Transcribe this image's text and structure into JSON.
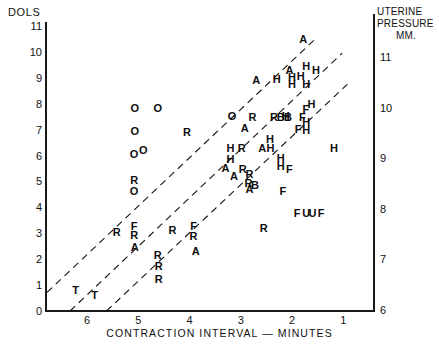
{
  "chart_data": {
    "type": "scatter",
    "title": "",
    "xlabel": "CONTRACTION  INTERVAL — MINUTES",
    "ylabel_left": "DOLS",
    "ylabel_right": "UTERINE PRESSURE MM.",
    "ylabel_right_lines": [
      "UTERINE",
      "PRESSURE",
      "MM."
    ],
    "xlim": [
      6.8,
      0.4
    ],
    "x_ticks": [
      "6",
      "5",
      "4",
      "3",
      "2",
      "1"
    ],
    "x_tick_values": [
      6,
      5,
      4,
      3,
      2,
      1
    ],
    "ylim_left": [
      0,
      11
    ],
    "y_ticks_left": [
      "0",
      "1",
      "2",
      "3",
      "4",
      "5",
      "6",
      "7",
      "8",
      "9",
      "10",
      "11"
    ],
    "y_tick_values_left": [
      0,
      1,
      2,
      3,
      4,
      5,
      6,
      7,
      8,
      9,
      10,
      11
    ],
    "ylim_right": [
      6,
      11
    ],
    "y_ticks_right": [
      "6",
      "7",
      "8",
      "9",
      "10",
      "11"
    ],
    "y_tick_values_right": [
      6,
      7,
      8,
      9,
      10,
      11
    ],
    "grid": false,
    "legend": "none",
    "marker_style": "letter-coded subject initials",
    "reference_lines": [
      {
        "name": "upper-isobar",
        "style": "dashed",
        "x1": 6.78,
        "y1": 0.72,
        "x2": 1.52,
        "y2": 10.55
      },
      {
        "name": "middle-isobar",
        "style": "dashed",
        "x1": 6.33,
        "y1": 0.0,
        "x2": 1.02,
        "y2": 9.95
      },
      {
        "name": "lower-isobar",
        "style": "dashed",
        "x1": 5.62,
        "y1": 0.0,
        "x2": 0.92,
        "y2": 8.75
      }
    ],
    "points": [
      {
        "label": "O",
        "x": 5.07,
        "y": 7.85
      },
      {
        "label": "O",
        "x": 4.62,
        "y": 7.85
      },
      {
        "label": "O",
        "x": 5.07,
        "y": 6.95
      },
      {
        "label": "R",
        "x": 4.05,
        "y": 6.92
      },
      {
        "label": "O",
        "x": 5.08,
        "y": 6.05
      },
      {
        "label": "O",
        "x": 4.9,
        "y": 6.22
      },
      {
        "label": "R",
        "x": 5.08,
        "y": 5.05
      },
      {
        "label": "O",
        "x": 5.08,
        "y": 4.62
      },
      {
        "label": "A",
        "x": 2.7,
        "y": 8.92
      },
      {
        "label": "O",
        "x": 3.17,
        "y": 7.52
      },
      {
        "label": "R",
        "x": 2.77,
        "y": 7.48
      },
      {
        "label": "R",
        "x": 2.35,
        "y": 7.48
      },
      {
        "label": "B",
        "x": 2.22,
        "y": 7.48
      },
      {
        "label": "B",
        "x": 2.08,
        "y": 7.48
      },
      {
        "label": "A",
        "x": 2.92,
        "y": 7.05
      },
      {
        "label": "A",
        "x": 3.3,
        "y": 5.52
      },
      {
        "label": "A",
        "x": 3.13,
        "y": 5.22
      },
      {
        "label": "H",
        "x": 3.2,
        "y": 6.3
      },
      {
        "label": "H",
        "x": 3.2,
        "y": 5.85
      },
      {
        "label": "R",
        "x": 2.98,
        "y": 6.3
      },
      {
        "label": "R",
        "x": 2.96,
        "y": 5.5
      },
      {
        "label": "R",
        "x": 2.83,
        "y": 5.3
      },
      {
        "label": "R",
        "x": 2.85,
        "y": 4.95
      },
      {
        "label": "A",
        "x": 2.83,
        "y": 4.72
      },
      {
        "label": "B",
        "x": 2.72,
        "y": 4.88
      },
      {
        "label": "A",
        "x": 1.78,
        "y": 10.48
      },
      {
        "label": "A",
        "x": 2.05,
        "y": 9.3
      },
      {
        "label": "H",
        "x": 1.72,
        "y": 9.45
      },
      {
        "label": "H",
        "x": 1.53,
        "y": 9.32
      },
      {
        "label": "H",
        "x": 2.0,
        "y": 9.05
      },
      {
        "label": "H",
        "x": 1.83,
        "y": 9.08
      },
      {
        "label": "H",
        "x": 2.3,
        "y": 8.95
      },
      {
        "label": "H",
        "x": 2.0,
        "y": 8.78
      },
      {
        "label": "H",
        "x": 1.72,
        "y": 8.78
      },
      {
        "label": "F",
        "x": 1.73,
        "y": 7.8
      },
      {
        "label": "H",
        "x": 1.62,
        "y": 7.98
      },
      {
        "label": "H",
        "x": 2.12,
        "y": 7.52
      },
      {
        "label": "F",
        "x": 1.8,
        "y": 7.48
      },
      {
        "label": "H",
        "x": 1.72,
        "y": 7.28
      },
      {
        "label": "F",
        "x": 1.88,
        "y": 7.02
      },
      {
        "label": "H",
        "x": 1.72,
        "y": 7.0
      },
      {
        "label": "H",
        "x": 2.43,
        "y": 6.62
      },
      {
        "label": "A",
        "x": 2.58,
        "y": 6.3
      },
      {
        "label": "H",
        "x": 2.42,
        "y": 6.28
      },
      {
        "label": "H",
        "x": 2.22,
        "y": 5.92
      },
      {
        "label": "H",
        "x": 2.22,
        "y": 5.58
      },
      {
        "label": "F",
        "x": 2.05,
        "y": 5.48
      },
      {
        "label": "H",
        "x": 1.18,
        "y": 6.3
      },
      {
        "label": "F",
        "x": 2.18,
        "y": 4.62
      },
      {
        "label": "F",
        "x": 1.9,
        "y": 3.78
      },
      {
        "label": "U",
        "x": 1.72,
        "y": 3.78
      },
      {
        "label": "U",
        "x": 1.6,
        "y": 3.78
      },
      {
        "label": "F",
        "x": 1.43,
        "y": 3.78
      },
      {
        "label": "R",
        "x": 2.55,
        "y": 3.22
      },
      {
        "label": "R",
        "x": 4.33,
        "y": 3.12
      },
      {
        "label": "F",
        "x": 3.92,
        "y": 3.3
      },
      {
        "label": "R",
        "x": 3.92,
        "y": 2.88
      },
      {
        "label": "A",
        "x": 3.88,
        "y": 2.32
      },
      {
        "label": "R",
        "x": 4.62,
        "y": 2.18
      },
      {
        "label": "R",
        "x": 4.6,
        "y": 1.72
      },
      {
        "label": "R",
        "x": 4.6,
        "y": 1.22
      },
      {
        "label": "F",
        "x": 5.08,
        "y": 3.28
      },
      {
        "label": "R",
        "x": 5.08,
        "y": 2.95
      },
      {
        "label": "R",
        "x": 5.42,
        "y": 3.05
      },
      {
        "label": "A",
        "x": 5.07,
        "y": 2.48
      },
      {
        "label": "T",
        "x": 6.22,
        "y": 0.8
      },
      {
        "label": "T",
        "x": 5.85,
        "y": 0.62
      }
    ]
  }
}
